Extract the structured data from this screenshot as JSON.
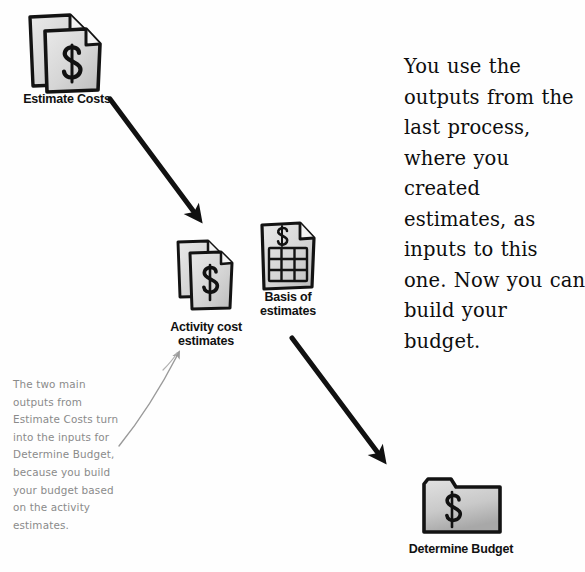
{
  "page": {
    "width": 585,
    "height": 572,
    "background": "#fefefe",
    "ink": "#111111",
    "handwriting_color": "#8a8a8a",
    "icon_fill": "#d8d8d8"
  },
  "nodes": [
    {
      "id": "estimate-costs",
      "label": "Estimate Costs",
      "icon": "stacked-dollar-documents-icon",
      "x": 28,
      "y": 12,
      "label_x": 8,
      "label_y": 92
    },
    {
      "id": "activity-cost-estimates",
      "label": "Activity cost\nestimates",
      "icon": "stacked-dollar-documents-icon",
      "x": 176,
      "y": 238,
      "label_x": 152,
      "label_y": 320
    },
    {
      "id": "basis-of-estimates",
      "label": "Basis of\nestimates",
      "icon": "dollar-grid-document-icon",
      "x": 259,
      "y": 221,
      "label_x": 248,
      "label_y": 290
    },
    {
      "id": "determine-budget",
      "label": "Determine Budget",
      "icon": "dollar-folder-icon",
      "x": 421,
      "y": 476,
      "label_x": 385,
      "label_y": 542
    }
  ],
  "arrows": [
    {
      "id": "arrow-estimate-to-activity",
      "from": "estimate-costs",
      "to": "activity-cost-estimates",
      "x1": 110,
      "y1": 99,
      "x2": 197,
      "y2": 216,
      "color": "#111111",
      "thickness": 5
    },
    {
      "id": "arrow-basis-to-budget",
      "from": "basis-of-estimates",
      "to": "determine-budget",
      "x1": 292,
      "y1": 338,
      "x2": 381,
      "y2": 457,
      "color": "#111111",
      "thickness": 5
    },
    {
      "id": "pointer-note-to-activity",
      "from": "handwritten-note",
      "to": "activity-cost-estimates",
      "x1": 119,
      "y1": 446,
      "x2": 179,
      "y2": 352,
      "color": "#9a9a9a",
      "thickness": 1.3
    }
  ],
  "blurb": {
    "id": "explanation-text",
    "text": "You use the outputs from the last process, where you created estimates, as inputs to this one. Now you can build your budget."
  },
  "handwritten_note": {
    "id": "handwritten-annotation",
    "text": "The two main\noutputs from\nEstimate Costs turn\ninto the inputs for\nDetermine Budget,\nbecause you build\nyour budget based\non the activity\nestimates."
  }
}
